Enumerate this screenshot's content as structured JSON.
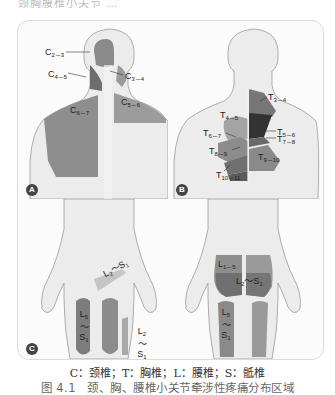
{
  "header_fragment": "颈胸腰椎小关节 …",
  "panels": {
    "A": {
      "badge": "A",
      "view": "posterior head, neck and upper back",
      "labels": {
        "c23": {
          "base": "C",
          "sub": "2－3"
        },
        "c34": {
          "base": "C",
          "sub": "3－4"
        },
        "c45": {
          "base": "C",
          "sub": "4－5"
        },
        "c56": {
          "base": "C",
          "sub": "5－6"
        },
        "c67": {
          "base": "C",
          "sub": "6－7"
        }
      }
    },
    "B": {
      "badge": "B",
      "view": "posterior thoracic back",
      "labels": {
        "t34": {
          "base": "T",
          "sub": "3－4"
        },
        "t45": {
          "base": "T",
          "sub": "4－5"
        },
        "t56": {
          "base": "T",
          "sub": "5－6"
        },
        "t67": {
          "base": "T",
          "sub": "6－7"
        },
        "t78": {
          "base": "T",
          "sub": "7－8"
        },
        "t89": {
          "base": "T",
          "sub": "8－9"
        },
        "t910": {
          "base": "T",
          "sub": "9－10"
        },
        "t1011": {
          "base": "T",
          "sub": "10－11"
        }
      }
    },
    "C": {
      "badge": "C",
      "views": [
        "anterior lower body",
        "posterior lower body"
      ],
      "labels": {
        "front_groin": {
          "a": "L",
          "a_sub": "2",
          "sep": "～",
          "b": "S",
          "b_sub": "1"
        },
        "front_thigh_left": {
          "a": "L",
          "a_sub": "5",
          "sep": "～",
          "b": "S",
          "b_sub": "1"
        },
        "front_thigh_right": {
          "a": "L",
          "a_sub": "2",
          "sep": "～",
          "b": "S",
          "b_sub": "1"
        },
        "back_lumbar": {
          "base": "L",
          "sub": "1－5"
        },
        "back_buttock": {
          "a": "L",
          "a_sub": "2",
          "sep": "～",
          "b": "S",
          "b_sub": "1"
        },
        "back_thigh": {
          "a": "L",
          "a_sub": "5",
          "sep": "～",
          "b": "S",
          "b_sub": "1"
        }
      }
    }
  },
  "colors": {
    "skin": "#ececec",
    "skin_edge": "#9a9a9a",
    "zone_light": "#a8a8a8",
    "zone_mid": "#8a8a8a",
    "zone_dark": "#555555",
    "zone_darkest": "#3a3a3a"
  },
  "legend": "C：颈椎；T：胸椎；L：腰椎；S：骶椎",
  "caption": "图 4.1　颈、胸、腰椎小关节牵涉性疼痛分布区域"
}
